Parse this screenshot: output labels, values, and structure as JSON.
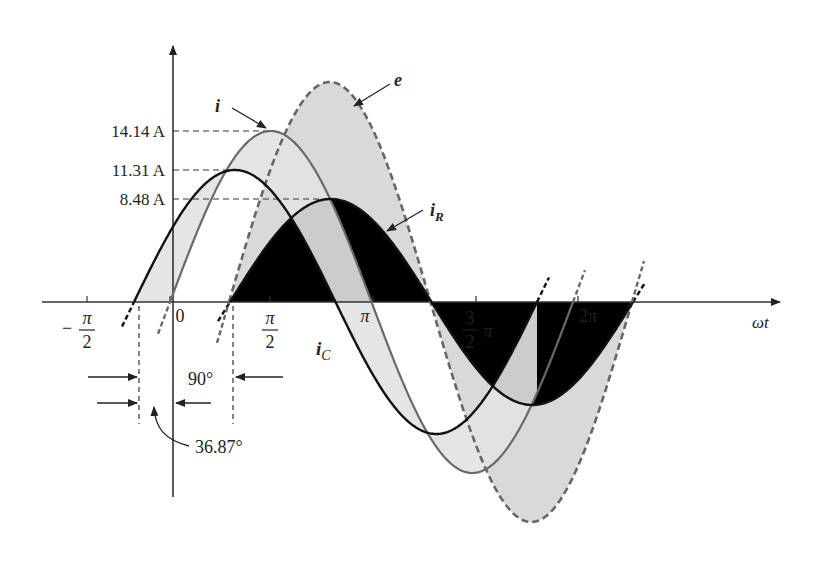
{
  "figure": {
    "title": "",
    "axis": {
      "x_label": "ωt",
      "ticks": [
        {
          "label_num": "π",
          "label_den": "2",
          "neg": true,
          "x": 87
        },
        {
          "label": "0",
          "x": 170
        },
        {
          "label_num": "π",
          "label_den": "2",
          "neg": false,
          "x": 270
        },
        {
          "label": "π",
          "x": 373
        },
        {
          "label_num": "3",
          "label_den": "2",
          "suffix": "π",
          "x": 476
        },
        {
          "label": "2π",
          "x": 578
        }
      ]
    },
    "amplitude_labels": [
      {
        "text": "14.14 A",
        "y": 131,
        "x_end": 270
      },
      {
        "text": "11.31 A",
        "y": 170,
        "x_end": 231
      },
      {
        "text": "8.48 A",
        "y": 199,
        "x_end": 331
      }
    ],
    "curve_labels": {
      "i": "i",
      "e": "e",
      "iR_main": "i",
      "iR_sub": "R",
      "iC_main": "i",
      "iC_sub": "C"
    },
    "angle_labels": {
      "ninety": "90°",
      "phase": "36.87°"
    },
    "colors": {
      "axis": "#333333",
      "i_curve": "#6a6a6a",
      "iC_curve": "#111111",
      "iR_curve": "#111111",
      "e_curve": "#666666",
      "e_fill": "#d9d9d9",
      "iR_fill": "#b5b5b5",
      "iC_fill": "#e2e2e2"
    }
  },
  "chart_data": {
    "type": "line",
    "xlabel": "ωt",
    "ylabel": "",
    "x_ticks": [
      "-π/2",
      "0",
      "π/2",
      "π",
      "3π/2",
      "2π"
    ],
    "series": [
      {
        "name": "i",
        "amplitude": 14.14,
        "unit": "A",
        "phase_deg": 0
      },
      {
        "name": "iC",
        "amplitude": 11.31,
        "unit": "A",
        "phase_deg": 36.87
      },
      {
        "name": "iR",
        "amplitude": 8.48,
        "unit": "A",
        "phase_deg": -53.13
      },
      {
        "name": "e",
        "amplitude": null,
        "unit": "V",
        "phase_deg": -53.13,
        "style": "dashed"
      }
    ],
    "annotations": [
      "90°",
      "36.87°",
      "14.14 A",
      "11.31 A",
      "8.48 A"
    ]
  }
}
